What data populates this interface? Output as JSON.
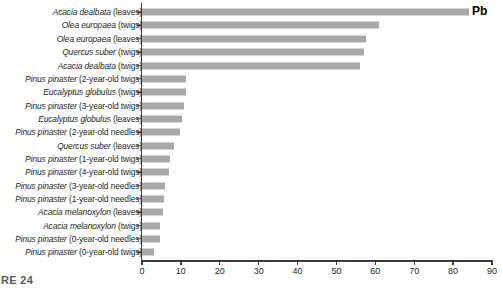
{
  "figure": {
    "series_label": "Pb",
    "caption": "RE 24"
  },
  "chart_data": {
    "type": "bar",
    "orientation": "horizontal",
    "title": "",
    "xlabel": "",
    "ylabel": "",
    "xlim": [
      0,
      90
    ],
    "xticks": [
      0,
      10,
      20,
      30,
      40,
      50,
      60,
      70,
      80,
      90
    ],
    "grid": false,
    "legend": "none",
    "annotations": [
      "Pb"
    ],
    "bar_color": "#a9a9a9",
    "axis_color": "#3b3b3b",
    "categories": [
      "Acacia dealbata (leaves)",
      "Olea europaea (twigs)",
      "Olea europaea (leaves)",
      "Quercus suber (twigs)",
      "Acacia dealbata (twigs)",
      "Pinus pinaster (2-year-old twigs)",
      "Eucalyptus globulus (twigs)",
      "Pinus pinaster (3-year-old twigs)",
      "Eucalyptus globulus (leaves)",
      "Pinus pinaster (2-year-old needles)",
      "Quercus suber (leaves)",
      "Pinus pinaster (1-year-old twigs)",
      "Pinus pinaster (4-year-old twigs)",
      "Pinus pinaster (3-year-old needles)",
      "Pinus pinaster (1-year-old needles)",
      "Acacia melanoxylon (leaves)",
      "Acacia melanoxylon (twigs)",
      "Pinus pinaster (0-year-old needles)",
      "Pinus pinaster (0-year-old twigs)"
    ],
    "label_parts": [
      {
        "species": "Acacia dealbata",
        "part": "(leaves)"
      },
      {
        "species": "Olea europaea",
        "part": "(twigs)"
      },
      {
        "species": "Olea europaea",
        "part": "(leaves)"
      },
      {
        "species": "Quercus suber",
        "part": "(twigs)"
      },
      {
        "species": "Acacia dealbata",
        "part": "(twigs)"
      },
      {
        "species": "Pinus pinaster",
        "part": "(2-year-old twigs)"
      },
      {
        "species": "Eucalyptus globulus",
        "part": "(twigs)"
      },
      {
        "species": "Pinus pinaster",
        "part": "(3-year-old twigs)"
      },
      {
        "species": "Eucalyptus globulus",
        "part": "(leaves)"
      },
      {
        "species": "Pinus pinaster",
        "part": "(2-year-old needles)"
      },
      {
        "species": "Quercus suber",
        "part": "(leaves)"
      },
      {
        "species": "Pinus pinaster",
        "part": "(1-year-old twigs)"
      },
      {
        "species": "Pinus pinaster",
        "part": "(4-year-old twigs)"
      },
      {
        "species": "Pinus pinaster",
        "part": "(3-year-old needles)"
      },
      {
        "species": "Pinus pinaster",
        "part": "(1-year-old needles)"
      },
      {
        "species": "Acacia melanoxylon",
        "part": "(leaves)"
      },
      {
        "species": "Acacia melanoxylon",
        "part": "(twigs)"
      },
      {
        "species": "Pinus pinaster",
        "part": "(0-year-old needles)"
      },
      {
        "species": "Pinus pinaster",
        "part": "(0-year-old twigs)"
      }
    ],
    "values": [
      84.0,
      61.0,
      57.5,
      57.0,
      56.0,
      11.3,
      11.2,
      10.7,
      10.3,
      9.8,
      8.2,
      7.3,
      7.0,
      6.0,
      5.6,
      5.4,
      4.7,
      4.6,
      3.2
    ]
  }
}
